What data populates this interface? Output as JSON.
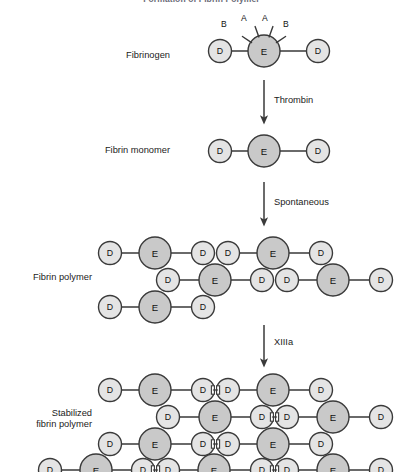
{
  "title": "Formation of Fibrin Polymer",
  "colors": {
    "e_fill": "#c9c9c9",
    "d_fill": "#e4e4e4",
    "stroke": "#3a3a3a",
    "link": "#3a3a3a",
    "title_color": "#6b6b78",
    "text": "#1b1b1b",
    "background": "#ffffff"
  },
  "domain_labels": {
    "d": "D",
    "e": "E"
  },
  "stages": [
    {
      "id": "fibrinogen",
      "label": "Fibrinogen",
      "label_lines": [
        "Fibrinogen"
      ],
      "label_x": 170,
      "label_y": 50,
      "peptides": [
        "B",
        "A",
        "A",
        "B"
      ],
      "nodes": [
        {
          "type": "D",
          "x": 220,
          "y": 51,
          "r": 11.5
        },
        {
          "type": "E",
          "x": 264,
          "y": 51,
          "r": 16
        },
        {
          "type": "D",
          "x": 318,
          "y": 51,
          "r": 11.5
        }
      ],
      "links": [
        [
          0,
          1
        ],
        [
          1,
          2
        ]
      ],
      "spikes": [
        {
          "label": "B",
          "angle": 214,
          "lx": 221,
          "ly": 19
        },
        {
          "label": "A",
          "angle": 250,
          "lx": 241,
          "ly": 13
        },
        {
          "label": "A",
          "angle": 290,
          "lx": 262,
          "ly": 13
        },
        {
          "label": "B",
          "angle": 326,
          "lx": 283,
          "ly": 19
        }
      ]
    },
    {
      "id": "fibrin-monomer",
      "label": "Fibrin monomer",
      "label_lines": [
        "Fibrin monomer"
      ],
      "label_x": 170,
      "label_y": 145,
      "nodes": [
        {
          "type": "D",
          "x": 220,
          "y": 151,
          "r": 11.5
        },
        {
          "type": "E",
          "x": 264,
          "y": 151,
          "r": 16
        },
        {
          "type": "D",
          "x": 318,
          "y": 151,
          "r": 11.5
        }
      ],
      "links": [
        [
          0,
          1
        ],
        [
          1,
          2
        ]
      ]
    },
    {
      "id": "fibrin-polymer",
      "label": "Fibrin polymer",
      "label_lines": [
        "Fibrin polymer"
      ],
      "label_x": 92,
      "label_y": 272,
      "nodes": [
        {
          "type": "D",
          "x": 110,
          "y": 253,
          "r": 11.5
        },
        {
          "type": "E",
          "x": 155,
          "y": 253,
          "r": 16
        },
        {
          "type": "D",
          "x": 203,
          "y": 253,
          "r": 11.5
        },
        {
          "type": "D",
          "x": 228,
          "y": 253,
          "r": 11.5
        },
        {
          "type": "E",
          "x": 273,
          "y": 253,
          "r": 16
        },
        {
          "type": "D",
          "x": 321,
          "y": 253,
          "r": 11.5
        },
        {
          "type": "D",
          "x": 168,
          "y": 280,
          "r": 11.5
        },
        {
          "type": "E",
          "x": 215,
          "y": 280,
          "r": 16
        },
        {
          "type": "D",
          "x": 262,
          "y": 280,
          "r": 11.5
        },
        {
          "type": "D",
          "x": 287,
          "y": 280,
          "r": 11.5
        },
        {
          "type": "E",
          "x": 333,
          "y": 280,
          "r": 16
        },
        {
          "type": "D",
          "x": 381,
          "y": 280,
          "r": 11.5
        },
        {
          "type": "D",
          "x": 110,
          "y": 307,
          "r": 11.5
        },
        {
          "type": "E",
          "x": 155,
          "y": 307,
          "r": 16
        },
        {
          "type": "D",
          "x": 203,
          "y": 307,
          "r": 11.5
        }
      ],
      "links": [
        [
          0,
          1
        ],
        [
          1,
          2
        ],
        [
          3,
          4
        ],
        [
          4,
          5
        ],
        [
          6,
          7
        ],
        [
          7,
          8
        ],
        [
          9,
          10
        ],
        [
          10,
          11
        ],
        [
          12,
          13
        ],
        [
          13,
          14
        ]
      ],
      "crosslinks": []
    },
    {
      "id": "stabilized-fibrin-polymer",
      "label": "Stabilized fibrin polymer",
      "label_lines": [
        "Stabilized",
        "fibrin polymer"
      ],
      "label_x": 92,
      "label_y": 408,
      "nodes": [
        {
          "type": "D",
          "x": 110,
          "y": 390,
          "r": 11.5
        },
        {
          "type": "E",
          "x": 155,
          "y": 390,
          "r": 16
        },
        {
          "type": "D",
          "x": 203,
          "y": 390,
          "r": 11.5
        },
        {
          "type": "D",
          "x": 228,
          "y": 390,
          "r": 11.5
        },
        {
          "type": "E",
          "x": 273,
          "y": 390,
          "r": 16
        },
        {
          "type": "D",
          "x": 321,
          "y": 390,
          "r": 11.5
        },
        {
          "type": "D",
          "x": 168,
          "y": 417,
          "r": 11.5
        },
        {
          "type": "E",
          "x": 215,
          "y": 417,
          "r": 16
        },
        {
          "type": "D",
          "x": 262,
          "y": 417,
          "r": 11.5
        },
        {
          "type": "D",
          "x": 287,
          "y": 417,
          "r": 11.5
        },
        {
          "type": "E",
          "x": 333,
          "y": 417,
          "r": 16
        },
        {
          "type": "D",
          "x": 381,
          "y": 417,
          "r": 11.5
        },
        {
          "type": "D",
          "x": 110,
          "y": 444,
          "r": 11.5
        },
        {
          "type": "E",
          "x": 155,
          "y": 444,
          "r": 16
        },
        {
          "type": "D",
          "x": 203,
          "y": 444,
          "r": 11.5
        },
        {
          "type": "D",
          "x": 228,
          "y": 444,
          "r": 11.5
        },
        {
          "type": "E",
          "x": 273,
          "y": 444,
          "r": 16
        },
        {
          "type": "D",
          "x": 321,
          "y": 444,
          "r": 11.5
        },
        {
          "type": "D",
          "x": 50,
          "y": 470,
          "r": 11.5
        },
        {
          "type": "E",
          "x": 96,
          "y": 470,
          "r": 16
        },
        {
          "type": "D",
          "x": 143,
          "y": 470,
          "r": 11.5
        },
        {
          "type": "D",
          "x": 168,
          "y": 470,
          "r": 11.5
        },
        {
          "type": "E",
          "x": 214,
          "y": 470,
          "r": 16
        },
        {
          "type": "D",
          "x": 262,
          "y": 470,
          "r": 11.5
        },
        {
          "type": "D",
          "x": 287,
          "y": 470,
          "r": 11.5
        },
        {
          "type": "E",
          "x": 333,
          "y": 470,
          "r": 16
        },
        {
          "type": "D",
          "x": 381,
          "y": 470,
          "r": 11.5
        }
      ],
      "links": [
        [
          0,
          1
        ],
        [
          1,
          2
        ],
        [
          3,
          4
        ],
        [
          4,
          5
        ],
        [
          6,
          7
        ],
        [
          7,
          8
        ],
        [
          9,
          10
        ],
        [
          10,
          11
        ],
        [
          12,
          13
        ],
        [
          13,
          14
        ],
        [
          15,
          16
        ],
        [
          16,
          17
        ],
        [
          18,
          19
        ],
        [
          19,
          20
        ],
        [
          21,
          22
        ],
        [
          22,
          23
        ],
        [
          24,
          25
        ],
        [
          25,
          26
        ]
      ],
      "crosslinks": [
        {
          "x": 215.5,
          "y": 390
        },
        {
          "x": 274.5,
          "y": 417
        },
        {
          "x": 215.5,
          "y": 444
        },
        {
          "x": 155.5,
          "y": 470
        },
        {
          "x": 274.5,
          "y": 470
        }
      ]
    }
  ],
  "arrows": [
    {
      "id": "thrombin-arrow",
      "label": "Thrombin",
      "x": 264,
      "y1": 80,
      "y2": 120,
      "lx": 274,
      "ly": 95
    },
    {
      "id": "spontaneous-arrow",
      "label": "Spontaneous",
      "x": 264,
      "y1": 182,
      "y2": 222,
      "lx": 274,
      "ly": 197
    },
    {
      "id": "xiiia-arrow",
      "label": "XIIIa",
      "x": 264,
      "y1": 325,
      "y2": 363,
      "lx": 274,
      "ly": 337
    }
  ]
}
